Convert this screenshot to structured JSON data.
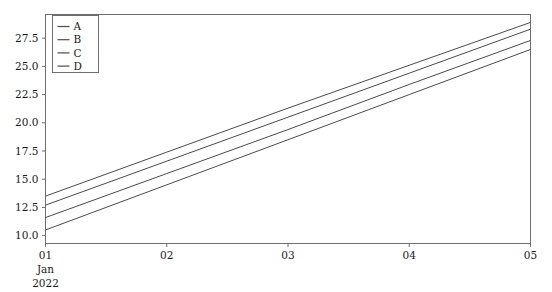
{
  "chart_data": {
    "type": "line",
    "title": "",
    "xlabel": "",
    "ylabel": "",
    "x": [
      "01",
      "02",
      "03",
      "04",
      "05"
    ],
    "x_tick_labels": [
      "01",
      "02",
      "03",
      "04",
      "05"
    ],
    "x_sublabels": [
      "Jan",
      "2022"
    ],
    "y_tick_labels": [
      "10.0",
      "12.5",
      "15.0",
      "17.5",
      "20.0",
      "22.5",
      "25.0",
      "27.5"
    ],
    "y_tick_values": [
      10.0,
      12.5,
      15.0,
      17.5,
      20.0,
      22.5,
      25.0,
      27.5
    ],
    "ylim": [
      9.3,
      29.6
    ],
    "xlim": [
      0,
      4
    ],
    "grid": false,
    "legend_position": "upper-left",
    "series": [
      {
        "name": "A",
        "color": "#4a4a4a",
        "values": [
          13.5,
          17.4,
          21.3,
          25.1,
          28.9
        ]
      },
      {
        "name": "B",
        "color": "#4a4a4a",
        "values": [
          12.7,
          16.6,
          20.5,
          24.4,
          28.3
        ]
      },
      {
        "name": "C",
        "color": "#4a4a4a",
        "values": [
          11.6,
          15.5,
          19.4,
          23.4,
          27.3
        ]
      },
      {
        "name": "D",
        "color": "#4a4a4a",
        "values": [
          10.5,
          14.5,
          18.5,
          22.5,
          26.5
        ]
      }
    ]
  },
  "legend": {
    "items": [
      {
        "label": "A"
      },
      {
        "label": "B"
      },
      {
        "label": "C"
      },
      {
        "label": "D"
      }
    ]
  },
  "axes": {
    "frame_color": "#6e6e6e",
    "background": "#ffffff"
  }
}
